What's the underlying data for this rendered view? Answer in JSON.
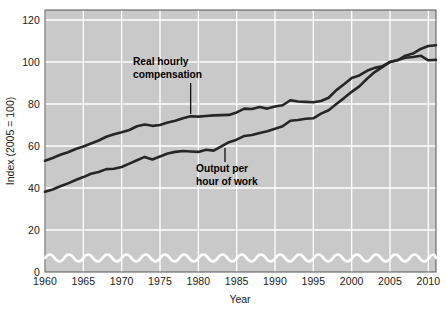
{
  "chart_data": {
    "type": "line",
    "title": "",
    "xlabel": "Year",
    "ylabel": "Index (2005 = 100)",
    "xlim": [
      1960,
      2011
    ],
    "ylim": [
      0,
      125
    ],
    "y_axis_break": true,
    "y_break_note": "wavy break between 0 and about 8 on the value axis",
    "grid": true,
    "grid_color": "#ffffff",
    "plot_background": "#c9c9c9",
    "line_color": "#262626",
    "legend_position": "inline-annotations",
    "xticks": [
      1960,
      1965,
      1970,
      1975,
      1980,
      1985,
      1990,
      1995,
      2000,
      2005,
      2010
    ],
    "xtick_labels": [
      "1960",
      "1965",
      "1970",
      "1975",
      "1980",
      "1985",
      "1990",
      "1995",
      "2000",
      "2005",
      "2010"
    ],
    "yticks": [
      0,
      20,
      40,
      60,
      80,
      100,
      120
    ],
    "ytick_labels": [
      "0",
      "20",
      "40",
      "60",
      "80",
      "100",
      "120"
    ],
    "x": [
      1960,
      1961,
      1962,
      1963,
      1964,
      1965,
      1966,
      1967,
      1968,
      1969,
      1970,
      1971,
      1972,
      1973,
      1974,
      1975,
      1976,
      1977,
      1978,
      1979,
      1980,
      1981,
      1982,
      1983,
      1984,
      1985,
      1986,
      1987,
      1988,
      1989,
      1990,
      1991,
      1992,
      1993,
      1994,
      1995,
      1996,
      1997,
      1998,
      1999,
      2000,
      2001,
      2002,
      2003,
      2004,
      2005,
      2006,
      2007,
      2008,
      2009,
      2010,
      2011
    ],
    "series": [
      {
        "name": "Real hourly compensation",
        "values": [
          53.0,
          54.3,
          55.8,
          57.0,
          58.6,
          59.8,
          61.2,
          62.6,
          64.4,
          65.6,
          66.5,
          67.6,
          69.4,
          70.2,
          69.6,
          70.0,
          71.2,
          72.0,
          73.2,
          74.2,
          74.0,
          74.3,
          74.6,
          74.7,
          74.8,
          76.0,
          77.8,
          77.6,
          78.6,
          77.8,
          78.8,
          79.4,
          81.8,
          81.2,
          81.0,
          80.8,
          81.4,
          83.0,
          86.6,
          89.4,
          92.4,
          93.6,
          95.8,
          97.2,
          98.0,
          100.0,
          100.8,
          103.0,
          104.0,
          106.2,
          107.6,
          108.0
        ],
        "annotation": {
          "text_line1": "Real hourly",
          "text_line2": "compensation",
          "pointer_year": 1979,
          "pointer_value": 74.3
        }
      },
      {
        "name": "Output per hour of work",
        "values": [
          38.2,
          39.3,
          40.8,
          42.2,
          43.8,
          45.2,
          46.8,
          47.6,
          49.0,
          49.2,
          50.0,
          51.6,
          53.2,
          54.8,
          53.6,
          55.0,
          56.4,
          57.2,
          57.6,
          57.4,
          57.2,
          58.2,
          57.8,
          59.8,
          61.8,
          63.0,
          64.8,
          65.2,
          66.2,
          67.0,
          68.2,
          69.4,
          72.0,
          72.4,
          73.0,
          73.2,
          75.4,
          77.0,
          80.0,
          82.8,
          85.8,
          88.4,
          92.0,
          95.2,
          97.6,
          100.0,
          101.0,
          102.0,
          102.4,
          103.0,
          100.8,
          101.0
        ]
      }
    ],
    "annotations": [
      {
        "id": "real-hourly-compensation",
        "line1": "Real hourly",
        "line2": "compensation"
      },
      {
        "id": "output-per-hour-of-work",
        "line1": "Output per",
        "line2": "hour of work"
      }
    ]
  }
}
